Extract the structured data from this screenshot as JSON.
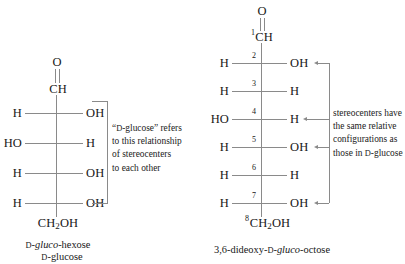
{
  "figure": {
    "background_color": "#ffffff",
    "bond_color": "#8a8a8a",
    "text_color": "#171717"
  },
  "left_structure": {
    "name": "d-gluco-hexose Fischer projection",
    "top_atom": "O",
    "carbon1": "CH",
    "terminal": "CH₂OH",
    "rows": [
      {
        "left": "H",
        "right": "OH"
      },
      {
        "left": "HO",
        "right": "H"
      },
      {
        "left": "H",
        "right": "OH"
      },
      {
        "left": "H",
        "right": "OH"
      }
    ],
    "caption_line1_prefix": "D",
    "caption_line1_italic": "gluco",
    "caption_line1_suffix": "-hexose",
    "caption_line2_prefix": "D",
    "caption_line2_suffix": "-glucose"
  },
  "left_note": {
    "line1_open_quote": "“",
    "line1_smallcap": "D",
    "line1_rest": "-glucose” refers",
    "line2": "to this relationship",
    "line3": "of stereocenters",
    "line4": "to each other"
  },
  "right_structure": {
    "name": "3,6-dideoxy-d-gluco-octose Fischer projection",
    "top_atom": "O",
    "carbon1_number": "1",
    "carbon1": "CH",
    "terminal_number": "8",
    "terminal": "CH₂OH",
    "rows": [
      {
        "number": "2",
        "left": "H",
        "right": "OH",
        "arrow": true
      },
      {
        "number": "3",
        "left": "H",
        "right": "H",
        "arrow": false
      },
      {
        "number": "4",
        "left": "HO",
        "right": "H",
        "arrow": true
      },
      {
        "number": "5",
        "left": "H",
        "right": "OH",
        "arrow": true
      },
      {
        "number": "6",
        "left": "H",
        "right": "H",
        "arrow": false
      },
      {
        "number": "7",
        "left": "H",
        "right": "OH",
        "arrow": true
      }
    ],
    "caption_prefix": "3,6-dideoxy-",
    "caption_smallcap": "D",
    "caption_dash": "-",
    "caption_italic": "gluco",
    "caption_suffix": "-octose"
  },
  "right_note": {
    "line1": "stereocenters have",
    "line2": "the same relative",
    "line3": "configurations as",
    "line4_prefix": "those in ",
    "line4_smallcap": "D",
    "line4_suffix": "-glucose"
  }
}
